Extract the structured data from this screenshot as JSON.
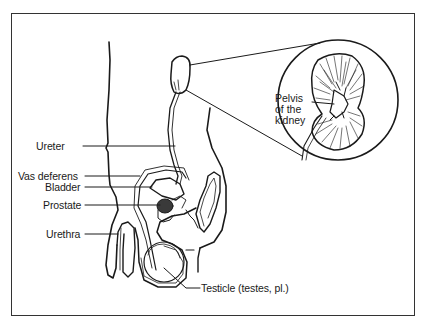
{
  "diagram": {
    "labels": {
      "ureter": "Ureter",
      "vas_deferens": "Vas deferens",
      "bladder": "Bladder",
      "prostate": "Prostate",
      "urethra": "Urethra",
      "testicle": "Testicle (testes, pl.)",
      "pelvis_line1": "Pelvis",
      "pelvis_line2": "of the",
      "pelvis_line3": "kidney"
    },
    "colors": {
      "line": "#1a1a1a",
      "background": "#ffffff",
      "frame": "#333333"
    }
  }
}
